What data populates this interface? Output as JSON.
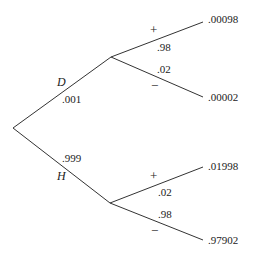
{
  "diagram": {
    "type": "probability-tree",
    "root": {
      "x": 13,
      "y": 128
    },
    "branches": [
      {
        "name": "D",
        "probability": ".001",
        "node": {
          "x": 111,
          "y": 57
        },
        "children": [
          {
            "sign": "+",
            "probability": ".98",
            "joint": ".00098",
            "end": {
              "x": 203,
              "y": 22
            }
          },
          {
            "sign": "−",
            "probability": ".02",
            "joint": ".00002",
            "end": {
              "x": 203,
              "y": 97
            }
          }
        ]
      },
      {
        "name": "H",
        "probability": ".999",
        "node": {
          "x": 110,
          "y": 203
        },
        "children": [
          {
            "sign": "+",
            "probability": ".02",
            "joint": ".01998",
            "end": {
              "x": 203,
              "y": 167
            }
          },
          {
            "sign": "−",
            "probability": ".98",
            "joint": ".97902",
            "end": {
              "x": 203,
              "y": 240
            }
          }
        ]
      }
    ]
  }
}
